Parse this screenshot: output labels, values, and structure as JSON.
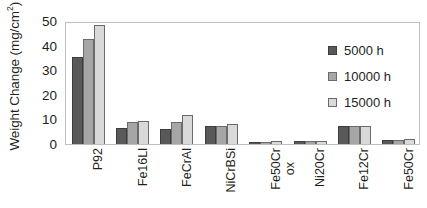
{
  "chart_data": {
    "type": "bar",
    "title": "",
    "xlabel": "",
    "ylabel": "Weight Change (mg/cm²)",
    "ylabel_text": "Weight Change (mg/cm",
    "ylabel_sup": "2",
    "ylabel_tail": ")",
    "ylim": [
      0,
      50
    ],
    "grid": false,
    "legend_position": "upper-right-inside",
    "y_ticks": [
      0,
      10,
      20,
      30,
      40,
      50
    ],
    "y_tick_labels": [
      "0",
      "10",
      "20",
      "30",
      "40",
      "50"
    ],
    "categories": [
      "P92",
      "Fe16Ll",
      "FeCrAl",
      "NiCrBSi",
      "Fe50Cr ox",
      "Ni20Cr",
      "Fe12Cr",
      "Fe50Cr"
    ],
    "category_labels": [
      {
        "line1": "P92",
        "line2": ""
      },
      {
        "line1": "Fe16Ll",
        "line2": ""
      },
      {
        "line1": "FeCrAl",
        "line2": ""
      },
      {
        "line1": "NiCrBSi",
        "line2": ""
      },
      {
        "line1": "Fe50Cr",
        "line2": "ox"
      },
      {
        "line1": "Ni20Cr",
        "line2": ""
      },
      {
        "line1": "Fe12Cr",
        "line2": ""
      },
      {
        "line1": "Fe50Cr",
        "line2": ""
      }
    ],
    "series": [
      {
        "name": "5000 h",
        "color": "#595959",
        "values": [
          35.5,
          6.5,
          6.2,
          7.2,
          0.7,
          1.1,
          7.2,
          1.5
        ]
      },
      {
        "name": "10000 h",
        "color": "#a6a6a6",
        "values": [
          42.5,
          8.8,
          8.8,
          7.2,
          1.0,
          1.1,
          7.2,
          1.5
        ]
      },
      {
        "name": "15000 h",
        "color": "#d9d9d9",
        "values": [
          48.5,
          9.3,
          11.8,
          8.3,
          1.2,
          1.2,
          7.2,
          2.2
        ]
      }
    ]
  },
  "legend": {
    "items": [
      {
        "label": "5000 h",
        "color": "#595959"
      },
      {
        "label": "10000 h",
        "color": "#a6a6a6"
      },
      {
        "label": "15000 h",
        "color": "#d9d9d9"
      }
    ]
  },
  "colors": {
    "series_5000h": "#595959",
    "series_10000h": "#a6a6a6",
    "series_15000h": "#d9d9d9",
    "axis_line": "#bfbfbf",
    "text": "#231f20",
    "background": "#ffffff"
  }
}
